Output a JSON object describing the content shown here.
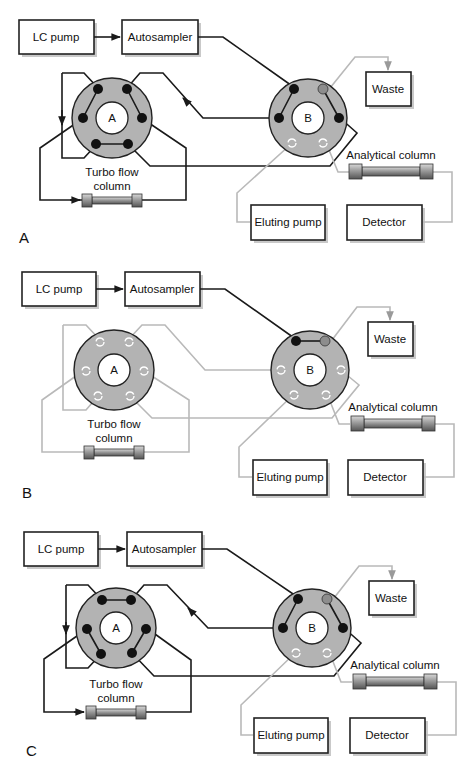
{
  "figure": {
    "panels": [
      {
        "id": "A",
        "panel_label": "A",
        "lc_pump": "LC pump",
        "autosampler": "Autosampler",
        "valve_a_label": "A",
        "valve_b_label": "B",
        "waste": "Waste",
        "turbo_flow_column_line1": "Turbo flow",
        "turbo_flow_column_line2": "column",
        "analytical_column": "Analytical column",
        "eluting_pump": "Eluting pump",
        "detector": "Detector",
        "state": "loading: LC pump flow through turbo flow column; eluting pump to analytical column"
      },
      {
        "id": "B",
        "panel_label": "B",
        "lc_pump": "LC pump",
        "autosampler": "Autosampler",
        "valve_a_label": "A",
        "valve_b_label": "B",
        "waste": "Waste",
        "turbo_flow_column_line1": "Turbo flow",
        "turbo_flow_column_line2": "column",
        "analytical_column": "Analytical column",
        "eluting_pump": "Eluting pump",
        "detector": "Detector",
        "state": "sample to waste; valve A paths inactive (grey)"
      },
      {
        "id": "C",
        "panel_label": "C",
        "lc_pump": "LC pump",
        "autosampler": "Autosampler",
        "valve_a_label": "A",
        "valve_b_label": "B",
        "waste": "Waste",
        "turbo_flow_column_line1": "Turbo flow",
        "turbo_flow_column_line2": "column",
        "analytical_column": "Analytical column",
        "eluting_pump": "Eluting pump",
        "detector": "Detector",
        "state": "valve A switched: turbo flow column back-flushed"
      }
    ],
    "colors": {
      "active_line": "#1a1a1a",
      "inactive_line": "#b9b9b9",
      "valve_fill": "#b3b3b3",
      "port_active": "#111111",
      "port_waste": "#8d8d8d"
    }
  }
}
